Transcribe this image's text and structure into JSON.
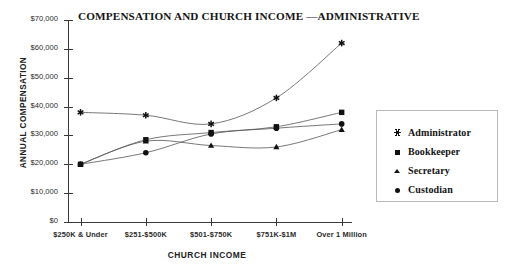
{
  "chart_data": {
    "type": "line",
    "title": "COMPENSATION AND CHURCH INCOME —ADMINISTRATIVE",
    "xlabel": "CHURCH INCOME",
    "ylabel": "ANNUAL COMPENSATION",
    "categories": [
      "$250K & Under",
      "$251-$500K",
      "$501-$750K",
      "$751K-$1M",
      "Over 1 Million"
    ],
    "ylim": [
      0,
      70000
    ],
    "ytick_values": [
      0,
      10000,
      20000,
      30000,
      40000,
      50000,
      60000,
      70000
    ],
    "ytick_labels": [
      "$0",
      "$10,000",
      "$20,000",
      "$30,000",
      "$40,000",
      "$50,000",
      "$60,000",
      "$70,000"
    ],
    "grid": false,
    "legend_position": "right",
    "series": [
      {
        "name": "Administrator",
        "marker": "star",
        "values": [
          38000,
          37000,
          34000,
          43000,
          62000
        ]
      },
      {
        "name": "Bookkeeper",
        "marker": "square",
        "values": [
          20000,
          28500,
          31000,
          33000,
          38000
        ]
      },
      {
        "name": "Secretary",
        "marker": "triangle",
        "values": [
          20000,
          28000,
          26500,
          26000,
          32000
        ]
      },
      {
        "name": "Custodian",
        "marker": "circle",
        "values": [
          20000,
          24000,
          30500,
          32500,
          34000
        ]
      }
    ]
  },
  "legend": {
    "items": [
      {
        "label": "Administrator",
        "marker": "star"
      },
      {
        "label": "Bookkeeper",
        "marker": "square"
      },
      {
        "label": "Secretary",
        "marker": "triangle"
      },
      {
        "label": "Custodian",
        "marker": "circle"
      }
    ]
  }
}
